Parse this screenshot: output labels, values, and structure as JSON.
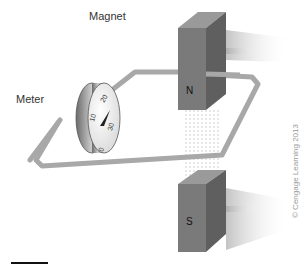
{
  "labels": {
    "magnet": "Magnet",
    "meter": "Meter",
    "north_pole": "N",
    "south_pole": "S",
    "copyright": "© Cengage Learning 2013"
  },
  "meter_dial": {
    "ticks": [
      "0",
      "10",
      "20",
      "30"
    ]
  },
  "colors": {
    "magnet_front": "#7a7a7a",
    "magnet_side": "#5f5f5f",
    "magnet_top": "#9a9a9a",
    "wire": "#a8a8a8",
    "field_lines": "#c8c8c8",
    "text": "#333333"
  }
}
